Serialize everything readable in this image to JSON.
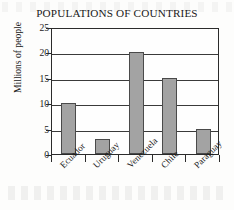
{
  "chart_data": {
    "type": "bar",
    "title": "POPULATIONS OF COUNTRIES",
    "xlabel": "",
    "ylabel": "Millions of people",
    "categories": [
      "Ecuador",
      "Uruguay",
      "Venezuela",
      "Chile",
      "Paraguay"
    ],
    "values": [
      10,
      3,
      20,
      15,
      5
    ],
    "yticks": [
      0,
      5,
      10,
      15,
      20,
      25
    ],
    "ylim": [
      0,
      25
    ],
    "grid": true,
    "legend": false,
    "bar_color": "#a3a3a3",
    "bar_border_color": "#4a4a4a",
    "axis_color": "#2b2b2b",
    "background_color": "#fdfdfc"
  }
}
